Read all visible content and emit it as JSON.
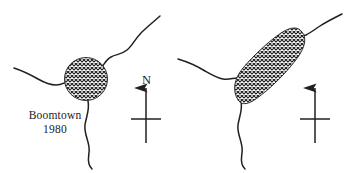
{
  "figure": {
    "type": "map-pair",
    "background_color": "#ffffff",
    "ink_color": "#231f20"
  },
  "maps": [
    {
      "id": "boomtown-1980",
      "caption_name": "Boomtown",
      "caption_year": "1980",
      "urban_area": {
        "name": "urban-extent",
        "shape": "circle",
        "fill": "cross-hatch",
        "fill_color": "#231f20"
      },
      "features": [
        {
          "name": "river-northeast",
          "type": "river",
          "style": "wavy-line"
        },
        {
          "name": "river-west",
          "type": "river",
          "style": "wavy-line"
        },
        {
          "name": "river-south",
          "type": "river",
          "style": "wavy-line"
        }
      ],
      "compass": {
        "name": "north-arrow",
        "label": "N",
        "style": "cross-with-arrow"
      }
    },
    {
      "id": "boomtown-2004",
      "caption_name": "Boomtown",
      "caption_year": "2004",
      "urban_area": {
        "name": "urban-extent",
        "shape": "elongated-oval-diagonal",
        "fill": "cross-hatch",
        "fill_color": "#231f20"
      },
      "features": [
        {
          "name": "river-northeast",
          "type": "river",
          "style": "wavy-line"
        },
        {
          "name": "river-west",
          "type": "river",
          "style": "wavy-line"
        },
        {
          "name": "river-south",
          "type": "river",
          "style": "wavy-line"
        }
      ],
      "compass": {
        "name": "north-arrow",
        "label": "N",
        "style": "cross-with-arrow"
      }
    }
  ]
}
